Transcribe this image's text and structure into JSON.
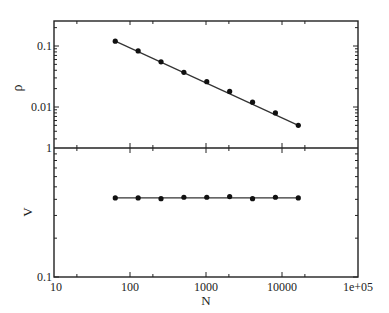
{
  "chart_data": [
    {
      "type": "scatter",
      "panel": "top",
      "title": "",
      "xlabel": "N",
      "ylabel": "ρ",
      "xscale": "log",
      "yscale": "log",
      "xlim": [
        10,
        100000
      ],
      "ylim": [
        0.0021,
        0.26
      ],
      "yticks": [
        {
          "value": 0.1,
          "label": "0.1"
        },
        {
          "value": 0.01,
          "label": "0.01"
        }
      ],
      "x": [
        64,
        128,
        256,
        512,
        1024,
        2048,
        4096,
        8192,
        16384
      ],
      "series": [
        {
          "name": "rho",
          "values": [
            0.12,
            0.083,
            0.055,
            0.037,
            0.026,
            0.018,
            0.012,
            0.008,
            0.005
          ],
          "line": "fit",
          "marker": "filled-circle"
        }
      ],
      "grid": false,
      "legend": null
    },
    {
      "type": "scatter",
      "panel": "bottom",
      "title": "",
      "xlabel": "N",
      "ylabel": "V",
      "xscale": "log",
      "yscale": "log",
      "xlim": [
        10,
        100000
      ],
      "ylim": [
        0.1,
        1
      ],
      "yticks": [
        {
          "value": 1,
          "label": "1"
        },
        {
          "value": 0.1,
          "label": "0.1"
        }
      ],
      "xticks": [
        {
          "value": 10,
          "label": "10"
        },
        {
          "value": 100,
          "label": "100"
        },
        {
          "value": 1000,
          "label": "1000"
        },
        {
          "value": 10000,
          "label": "10000"
        },
        {
          "value": 100000,
          "label": "1e+05"
        }
      ],
      "x": [
        64,
        128,
        256,
        512,
        1024,
        2048,
        4096,
        8192,
        16384
      ],
      "series": [
        {
          "name": "V",
          "values": [
            0.41,
            0.41,
            0.405,
            0.415,
            0.415,
            0.42,
            0.405,
            0.415,
            0.41
          ],
          "line": "constant-fit",
          "fit_value": 0.41,
          "marker": "filled-circle"
        }
      ],
      "grid": false,
      "legend": null
    }
  ],
  "labels": {
    "xlabel": "N",
    "top_ylabel": "ρ",
    "bottom_ylabel": "V"
  },
  "colors": {
    "axis": "#222222",
    "marker": "#111111",
    "line": "#333333"
  }
}
